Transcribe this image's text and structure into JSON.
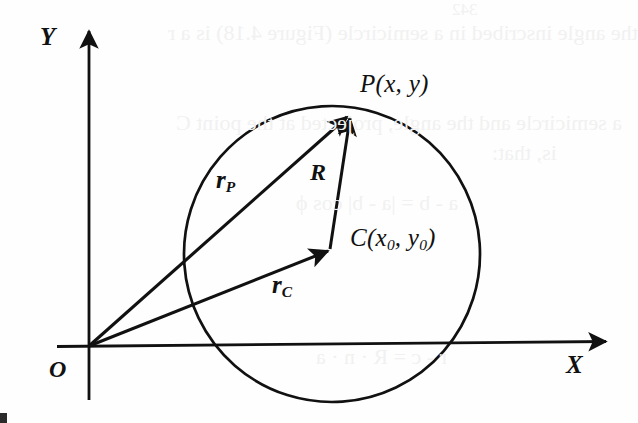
{
  "figure": {
    "background_color": "#fefefe",
    "ink_color": "#111111",
    "width": 638,
    "height": 423
  },
  "axes": {
    "x_label": "X",
    "y_label": "Y",
    "origin_label": "O",
    "origin_point": {
      "x": 89,
      "y": 346
    },
    "x_axis": {
      "from_x": 57,
      "to_x": 612,
      "y": 346,
      "arrow": "right"
    },
    "y_axis": {
      "x": 89,
      "from_y": 400,
      "to_y": 27,
      "arrow": "up"
    }
  },
  "circle": {
    "center": {
      "x": 332,
      "y": 254
    },
    "radius": 148,
    "stroke_width": 2.6
  },
  "points": [
    {
      "name": "P",
      "label": "P(x, y)",
      "x": 352,
      "y": 112
    },
    {
      "name": "C",
      "label_main": "C(x",
      "label_sub1": "0",
      "label_mid": ", y",
      "label_sub2": "0",
      "label_end": ")",
      "x": 332,
      "y": 254
    },
    {
      "name": "O",
      "label": "O",
      "x": 89,
      "y": 346
    }
  ],
  "vectors": [
    {
      "id": "r_P",
      "label_main": "r",
      "label_sub": "P",
      "description": "position vector from origin to point P",
      "from": {
        "x": 89,
        "y": 346
      },
      "to": {
        "x": 352,
        "y": 112
      },
      "label_pos": {
        "x": 205,
        "y": 178
      }
    },
    {
      "id": "r_C",
      "label_main": "r",
      "label_sub": "C",
      "description": "position vector from origin to circle center C",
      "from": {
        "x": 89,
        "y": 346
      },
      "to": {
        "x": 332,
        "y": 254
      },
      "label_pos": {
        "x": 264,
        "y": 279
      }
    },
    {
      "id": "R",
      "label_main": "R",
      "label_sub": "",
      "description": "radius vector from center C to point P",
      "from": {
        "x": 332,
        "y": 254
      },
      "to": {
        "x": 352,
        "y": 112
      },
      "label_pos": {
        "x": 310,
        "y": 170
      }
    }
  ],
  "labels": {
    "point_p": "P(x, y)",
    "point_c_prefix": "C(x",
    "point_c_sub_a": "0",
    "point_c_middle": ", y",
    "point_c_sub_b": "0",
    "point_c_suffix": ")",
    "radius": "R",
    "vector_rp_base": "r",
    "vector_rp_sub": "P",
    "vector_rc_base": "r",
    "vector_rc_sub": "C",
    "axis_x": "X",
    "axis_y": "Y",
    "origin": "O"
  },
  "bleedthrough": {
    "note": "faint mirrored show-through text from the reverse page",
    "lines": [
      {
        "text": "342",
        "x": 470,
        "y": 2,
        "size": 17
      },
      {
        "text": "the angle inscribed in a semicircle (Figure 4.18) is a r",
        "x": 180,
        "y": 28,
        "size": 21
      },
      {
        "text": "a semicircle and the angle, projected at the point C",
        "x": 186,
        "y": 118,
        "size": 21
      },
      {
        "text": "is, that:",
        "x": 500,
        "y": 148,
        "size": 21
      },
      {
        "text": "a - b = |a - b| cos ϕ",
        "x": 300,
        "y": 196,
        "size": 20
      },
      {
        "text": "r - c = R · n · a",
        "x": 320,
        "y": 350,
        "size": 20
      }
    ]
  }
}
